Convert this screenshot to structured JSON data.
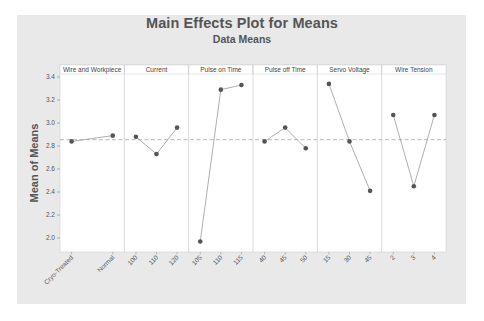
{
  "chart": {
    "title": "Main Effects Plot for Means",
    "subtitle": "Data Means",
    "ylabel": "Mean of Means"
  },
  "colors": {
    "background": "#e9e9e9",
    "plot_area": "#ffffff",
    "line": "#9a9a9a",
    "point": "#555555",
    "mean_line": "#999999",
    "panel_header": "#ffffff",
    "divider": "#cccccc"
  },
  "chart_data": {
    "type": "line",
    "title": "Main Effects Plot for Means",
    "subtitle": "Data Means",
    "xlabel": "",
    "ylabel": "Mean of Means",
    "ylim": [
      1.9,
      3.4
    ],
    "yticks": [
      2.0,
      2.2,
      2.4,
      2.6,
      2.8,
      3.0,
      3.2,
      3.4
    ],
    "grand_mean": 2.855,
    "grid": false,
    "legend": null,
    "panels": [
      {
        "factor": "Wire and Workpiece",
        "levels": [
          "Cryo-Treated",
          "Normal"
        ],
        "values": [
          2.84,
          2.89
        ]
      },
      {
        "factor": "Current",
        "levels": [
          "100",
          "110",
          "120"
        ],
        "values": [
          2.88,
          2.73,
          2.96
        ]
      },
      {
        "factor": "Pulse on Time",
        "levels": [
          "105",
          "110",
          "115"
        ],
        "values": [
          1.97,
          3.29,
          3.33
        ]
      },
      {
        "factor": "Pulse off Time",
        "levels": [
          "40",
          "45",
          "50"
        ],
        "values": [
          2.84,
          2.96,
          2.78
        ]
      },
      {
        "factor": "Servo Voltage",
        "levels": [
          "15",
          "30",
          "45"
        ],
        "values": [
          3.34,
          2.84,
          2.41
        ]
      },
      {
        "factor": "Wire Tension",
        "levels": [
          "2",
          "3",
          "4"
        ],
        "values": [
          3.07,
          2.45,
          3.07
        ]
      }
    ]
  }
}
